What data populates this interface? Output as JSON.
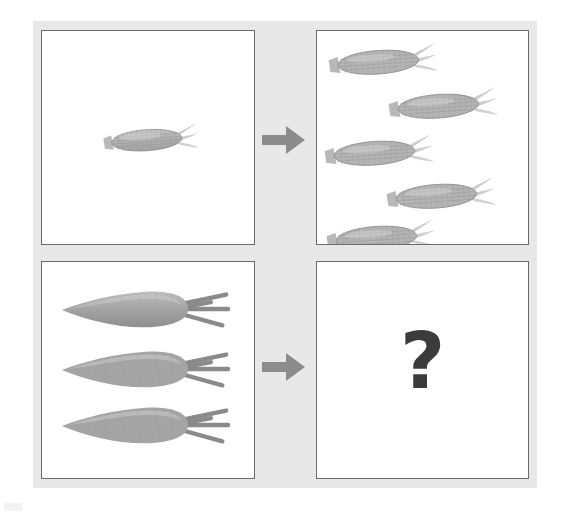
{
  "figure": {
    "kind": "visual-analogy-puzzle",
    "layout": "2x2 grid of white panels with gray arrows between columns",
    "background_color": "#e8e8e8",
    "panel_background": "#ffffff",
    "panel_border_color": "#6b6b6b"
  },
  "arrows": {
    "icon": "arrow-right-icon",
    "color": "#8c8c8c",
    "top_label": "becomes",
    "bottom_label": "becomes"
  },
  "panels": {
    "source_top": {
      "name": "top-left-panel",
      "item": "corn",
      "count": 1,
      "items": [
        {
          "label": "corn",
          "x": 60,
          "y": 92,
          "width": 96,
          "height": 34,
          "rotation": -4
        }
      ]
    },
    "result_top": {
      "name": "top-right-panel",
      "item": "corn",
      "count": 5,
      "items": [
        {
          "label": "corn",
          "x": 10,
          "y": 12,
          "width": 110,
          "height": 38,
          "rotation": -4
        },
        {
          "label": "corn",
          "x": 70,
          "y": 56,
          "width": 110,
          "height": 38,
          "rotation": -4
        },
        {
          "label": "corn",
          "x": 6,
          "y": 103,
          "width": 110,
          "height": 38,
          "rotation": -4
        },
        {
          "label": "corn",
          "x": 68,
          "y": 146,
          "width": 110,
          "height": 38,
          "rotation": -4
        },
        {
          "label": "corn",
          "x": 8,
          "y": 188,
          "width": 110,
          "height": 38,
          "rotation": -4
        }
      ]
    },
    "source_bottom": {
      "name": "bottom-left-panel",
      "item": "carrot",
      "count": 3,
      "items": [
        {
          "label": "carrot",
          "x": 16,
          "y": 21,
          "width": 172,
          "height": 50,
          "rotation": 0
        },
        {
          "label": "carrot",
          "x": 16,
          "y": 81,
          "width": 172,
          "height": 50,
          "rotation": 0
        },
        {
          "label": "carrot",
          "x": 16,
          "y": 137,
          "width": 172,
          "height": 50,
          "rotation": 0
        }
      ]
    },
    "result_bottom": {
      "name": "bottom-right-panel",
      "item": "question-mark",
      "count": 1,
      "question_mark": "?",
      "question_mark_color": "#3b3b3b"
    }
  },
  "colors": {
    "corn_body": "#b4b4b4",
    "corn_kernel_line": "#9a9a9a",
    "corn_silk": "#c9c9c9",
    "carrot_body": "#9e9e9e",
    "carrot_highlight": "#c2c2c2",
    "carrot_stem": "#8a8a8a",
    "arrow": "#8c8c8c",
    "question": "#3b3b3b"
  }
}
